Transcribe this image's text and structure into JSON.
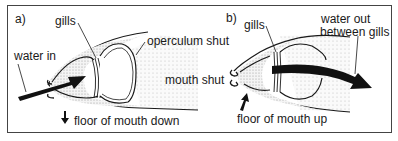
{
  "figure": {
    "panel_a": {
      "label": "a)",
      "gills": "gills",
      "water_in": "water in",
      "operculum": "operculum shut",
      "floor": "floor of mouth down"
    },
    "panel_b": {
      "label": "b)",
      "gills": "gills",
      "mouth": "mouth shut",
      "water_out_line1": "water out",
      "water_out_line2": "between gills",
      "floor": "floor of mouth up"
    }
  },
  "colors": {
    "ink": "#1a1a1a",
    "stipple": "#d9d9d9",
    "frame": "#444444"
  }
}
